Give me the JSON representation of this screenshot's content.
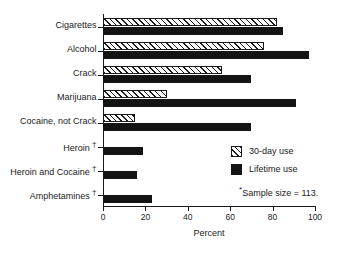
{
  "chart_data": {
    "type": "bar",
    "orientation": "horizontal",
    "title": "",
    "xlabel": "Percent",
    "ylabel": "",
    "xlim": [
      0,
      100
    ],
    "xticks": [
      0,
      20,
      40,
      60,
      80,
      100
    ],
    "grid": false,
    "legend_position": "center-right",
    "categories": [
      "Cigarettes",
      "Alcohol",
      "Crack",
      "Marijuana",
      "Cocaine, not Crack",
      "Heroin",
      "Heroin and Cocaine",
      "Amphetamines"
    ],
    "category_footnote_markers": [
      "",
      "",
      "",
      "",
      "",
      "†",
      "†",
      "†"
    ],
    "series": [
      {
        "name": "30-day use",
        "pattern": "diagonal-hatch",
        "values": [
          82,
          76,
          56,
          30,
          15,
          0,
          0,
          0
        ]
      },
      {
        "name": "Lifetime use",
        "pattern": "solid-black",
        "values": [
          85,
          97,
          70,
          91,
          70,
          19,
          16,
          23
        ]
      }
    ],
    "annotations": [
      "*Sample size = 113."
    ]
  },
  "axis": {
    "x_title": "Percent",
    "x_tick_labels": [
      "0",
      "20",
      "40",
      "60",
      "80",
      "100"
    ]
  },
  "legend": {
    "items": [
      {
        "label": "30-day use",
        "swatch": "hatched-swatch"
      },
      {
        "label": "Lifetime use",
        "swatch": "solid-swatch"
      }
    ]
  },
  "footnote": {
    "star": "*",
    "text": "Sample size = 113."
  },
  "categories": [
    {
      "label": "Cigarettes",
      "dagger": ""
    },
    {
      "label": "Alcohol",
      "dagger": ""
    },
    {
      "label": "Crack",
      "dagger": ""
    },
    {
      "label": "Marijuana",
      "dagger": ""
    },
    {
      "label": "Cocaine, not Crack",
      "dagger": ""
    },
    {
      "label": "Heroin",
      "dagger": "†"
    },
    {
      "label": "Heroin and Cocaine",
      "dagger": "†"
    },
    {
      "label": "Amphetamines",
      "dagger": "†"
    }
  ]
}
